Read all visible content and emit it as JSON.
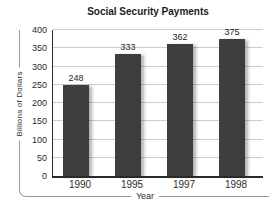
{
  "chart_data": {
    "type": "bar",
    "title": "Social Security Payments",
    "categories": [
      "1990",
      "1995",
      "1997",
      "1998"
    ],
    "values": [
      248,
      333,
      362,
      375
    ],
    "xlabel": "Year",
    "ylabel": "Billions of Dollars",
    "ylim": [
      0,
      400
    ],
    "yticks": [
      0,
      50,
      100,
      150,
      200,
      250,
      300,
      350,
      400
    ],
    "grid": "horizontal",
    "legend": "none",
    "bar_color": "#3e3e40",
    "axis_color": "#2b2b2b",
    "gridline_color": "#cccccc",
    "bracket_color": "#9a9a9a",
    "title_color": "#1c1c1c",
    "label_color": "#2a2a2a",
    "background": "#ffffff"
  }
}
